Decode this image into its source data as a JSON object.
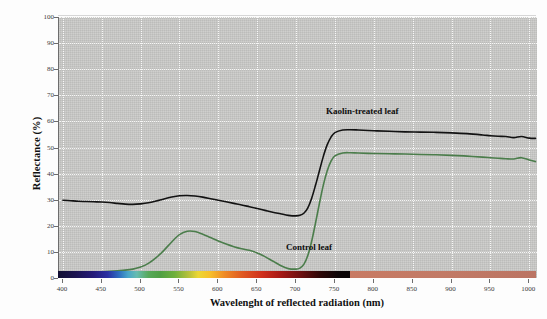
{
  "chart_data": {
    "type": "line",
    "title": "",
    "xlabel": "Wavelenght of reflected radiation (nm)",
    "ylabel": "Reflectance (%)",
    "xlim": [
      395,
      1010
    ],
    "ylim": [
      0,
      100
    ],
    "xticks": [
      400,
      450,
      500,
      550,
      600,
      650,
      700,
      750,
      800,
      850,
      900,
      950,
      1000
    ],
    "yticks": [
      0,
      10,
      20,
      30,
      40,
      50,
      60,
      70,
      80,
      90,
      100
    ],
    "grid": true,
    "legend_position": "inline-annotation",
    "x": [
      400,
      410,
      420,
      430,
      440,
      450,
      460,
      470,
      480,
      490,
      500,
      510,
      520,
      530,
      540,
      550,
      560,
      570,
      580,
      590,
      600,
      610,
      620,
      630,
      640,
      650,
      660,
      670,
      680,
      690,
      700,
      705,
      710,
      715,
      720,
      725,
      730,
      735,
      740,
      745,
      750,
      760,
      770,
      780,
      800,
      820,
      840,
      860,
      880,
      900,
      920,
      940,
      950,
      960,
      970,
      980,
      990,
      1000,
      1008
    ],
    "series": [
      {
        "name": "Kaolin-treated leaf",
        "color": "#121212",
        "values": [
          29.8,
          29.6,
          29.4,
          29.3,
          29.2,
          29.1,
          28.9,
          28.6,
          28.3,
          28.2,
          28.4,
          28.8,
          29.5,
          30.3,
          31.0,
          31.5,
          31.6,
          31.4,
          31.0,
          30.4,
          29.8,
          29.2,
          28.6,
          28.0,
          27.3,
          26.6,
          25.9,
          25.2,
          24.6,
          24.0,
          23.8,
          24.0,
          24.8,
          26.8,
          30.5,
          35.5,
          41.0,
          46.5,
          51.0,
          54.0,
          55.7,
          56.7,
          56.8,
          56.7,
          56.4,
          56.2,
          56.0,
          55.9,
          55.8,
          55.6,
          55.3,
          54.8,
          54.5,
          54.3,
          54.2,
          53.8,
          54.2,
          53.6,
          53.5
        ]
      },
      {
        "name": "Control leaf",
        "color": "#4b7d4b",
        "values": [
          1.4,
          1.6,
          1.8,
          2.0,
          2.2,
          2.4,
          2.6,
          2.8,
          3.0,
          3.4,
          4.2,
          5.6,
          7.8,
          10.6,
          13.8,
          16.6,
          17.9,
          17.8,
          16.8,
          15.5,
          14.2,
          13.0,
          12.0,
          11.2,
          10.6,
          9.6,
          8.2,
          6.5,
          4.8,
          3.6,
          3.4,
          3.8,
          5.2,
          8.5,
          14.0,
          21.0,
          28.5,
          35.5,
          41.0,
          44.8,
          46.8,
          47.9,
          48.0,
          47.9,
          47.7,
          47.6,
          47.5,
          47.3,
          47.2,
          47.0,
          46.7,
          46.3,
          46.1,
          45.9,
          45.7,
          45.6,
          46.1,
          45.2,
          44.6
        ]
      }
    ],
    "annotations": [
      {
        "name": "kaolin-label",
        "text": "Kaolin-treated leaf",
        "x": 830,
        "y": 62
      },
      {
        "name": "control-label",
        "text": "Control leaf",
        "x": 735,
        "y": 9.5
      }
    ],
    "spectrum_bar": {
      "name": "visible-to-nir-color-bar",
      "visible_range": [
        400,
        780
      ],
      "nir_range": [
        780,
        1008
      ]
    }
  },
  "axis": {
    "y_title": "Reflectance (%)",
    "x_title": "Wavelenght of reflected radiation (nm)",
    "y_tick_labels": [
      "100",
      "90",
      "80",
      "70",
      "60",
      "50",
      "40",
      "30",
      "20",
      "10",
      "0"
    ],
    "x_tick_labels": [
      "400",
      "450",
      "500",
      "550",
      "600",
      "650",
      "700",
      "750",
      "800",
      "850",
      "900",
      "950",
      "1000"
    ]
  },
  "colors": {
    "plot_background": "#c9c9c7",
    "grid": "#ffffff",
    "kaolin_series": "#121212",
    "control_series": "#4b7d4b",
    "axis_line": "#6d6d6d",
    "page_background": "#fdfdfd"
  }
}
